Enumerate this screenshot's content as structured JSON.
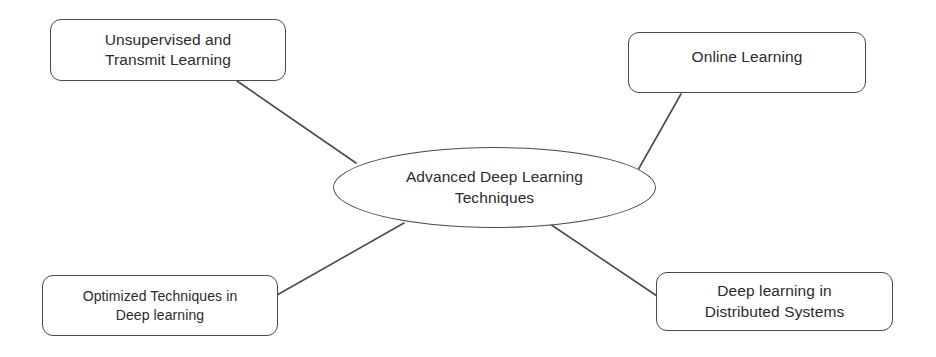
{
  "diagram": {
    "type": "mind-map",
    "title": "Advanced Deep Learning Techniques",
    "stroke_color": "#4a4a4a",
    "text_color": "#2b2b2b",
    "background_color": "#ffffff",
    "center": {
      "id": "advanced-deep-learning-techniques",
      "shape": "ellipse",
      "label": "Advanced Deep Learning\nTechniques"
    },
    "nodes": [
      {
        "id": "unsupervised-and-transmit-learning",
        "shape": "rounded-rectangle",
        "position": "top-left",
        "label": "Unsupervised and\nTransmit Learning"
      },
      {
        "id": "online-learning",
        "shape": "rounded-rectangle",
        "position": "top-right",
        "label": "Online Learning"
      },
      {
        "id": "optimized-techniques-in-deep-learning",
        "shape": "rounded-rectangle",
        "position": "bottom-left",
        "label": "Optimized Techniques in\nDeep learning"
      },
      {
        "id": "deep-learning-in-distributed-systems",
        "shape": "rounded-rectangle",
        "position": "bottom-right",
        "label": "Deep learning in\nDistributed Systems"
      }
    ],
    "connectors": [
      {
        "id": "connector-unsupervised",
        "from": "unsupervised-and-transmit-learning",
        "to": "advanced-deep-learning-techniques",
        "x1": 237,
        "y1": 81,
        "x2": 356,
        "y2": 163
      },
      {
        "id": "connector-online",
        "from": "online-learning",
        "to": "advanced-deep-learning-techniques",
        "x1": 681,
        "y1": 94,
        "x2": 638,
        "y2": 170
      },
      {
        "id": "connector-optimized",
        "from": "optimized-techniques-in-deep-learning",
        "to": "advanced-deep-learning-techniques",
        "x1": 277,
        "y1": 295,
        "x2": 404,
        "y2": 223
      },
      {
        "id": "connector-distributed",
        "from": "advanced-deep-learning-techniques",
        "to": "deep-learning-in-distributed-systems",
        "x1": 547,
        "y1": 222,
        "x2": 657,
        "y2": 296
      }
    ]
  }
}
